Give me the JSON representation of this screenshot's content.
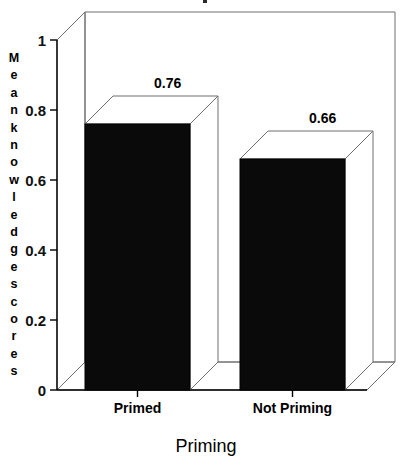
{
  "chart_data": {
    "type": "bar",
    "style": "3d-column",
    "title": "",
    "xlabel": "Priming",
    "ylabel": "Mean knowledge scores",
    "categories": [
      "Primed",
      "Not Priming"
    ],
    "values": [
      0.76,
      0.66
    ],
    "data_labels": [
      "0.76",
      "0.66"
    ],
    "ylim": [
      0,
      1
    ],
    "ytick_values": [
      0,
      0.2,
      0.4,
      0.6,
      0.8,
      1
    ],
    "ytick_labels": [
      "0",
      "0.2",
      "0.4",
      "0.6",
      "0.8",
      "1"
    ],
    "grid": false,
    "legend": false,
    "legend_position": "none",
    "series": [
      {
        "name": "Mean knowledge scores",
        "values": [
          0.76,
          0.66
        ],
        "color": "#0a0a0a"
      }
    ],
    "colors": {
      "bar_front": "#0a0a0a",
      "bar_top": "#ffffff",
      "bar_side": "#ffffff",
      "frame": "#6f6f6f",
      "axis": "#000000",
      "background": "#ffffff",
      "text": "#000000"
    },
    "ylabel_chars": [
      "M",
      "e",
      "a",
      "n",
      "k",
      "n",
      "o",
      "w",
      "l",
      "e",
      "d",
      "g",
      "e",
      "s",
      "c",
      "o",
      "r",
      "e",
      "s"
    ]
  }
}
